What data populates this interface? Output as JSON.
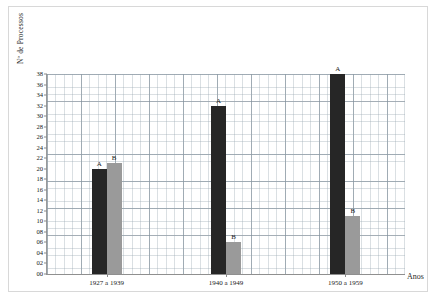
{
  "chart_data": {
    "type": "bar",
    "title": "",
    "xlabel": "Anos",
    "ylabel": "Nº de Processos",
    "categories": [
      "1927 a 1939",
      "1940 a 1949",
      "1950 a 1959"
    ],
    "series": [
      {
        "name": "A",
        "label": "A",
        "color": "#262626",
        "values": [
          20,
          32,
          38
        ]
      },
      {
        "name": "B",
        "label": "B",
        "color": "#9a9a9a",
        "values": [
          21,
          6,
          11
        ]
      }
    ],
    "ylim": [
      0,
      38
    ],
    "ytick_step": 2,
    "ytick_labels": [
      "38",
      "36",
      "34",
      "32",
      "30",
      "28",
      "26",
      "24",
      "22",
      "20",
      "18",
      "16",
      "14",
      "12",
      "10",
      "08",
      "06",
      "04",
      "02",
      "00"
    ],
    "ytick_values": [
      38,
      36,
      34,
      32,
      30,
      28,
      26,
      24,
      22,
      20,
      18,
      16,
      14,
      12,
      10,
      8,
      6,
      4,
      2,
      0
    ],
    "grid": true,
    "legend_position": "none",
    "point_labels_shown": true
  },
  "figure": {
    "caption": ""
  }
}
